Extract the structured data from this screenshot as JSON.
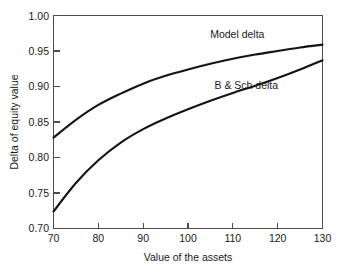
{
  "chart_data": {
    "type": "line",
    "title": "",
    "xlabel": "Value of the assets",
    "ylabel": "Delta of equity value",
    "xlim": [
      70,
      130
    ],
    "ylim": [
      0.7,
      1.0
    ],
    "xticks": [
      "70",
      "80",
      "90",
      "100",
      "110",
      "120",
      "130"
    ],
    "yticks": [
      "0.70",
      "0.75",
      "0.80",
      "0.85",
      "0.90",
      "0.95",
      "1.00"
    ],
    "grid": false,
    "legend_position": "inline-annotations",
    "x": [
      70,
      75,
      80,
      85,
      90,
      95,
      100,
      105,
      110,
      115,
      120,
      125,
      130
    ],
    "series": [
      {
        "name": "Model delta",
        "label": "Model delta",
        "color": "#141414",
        "values": [
          0.828,
          0.853,
          0.874,
          0.89,
          0.904,
          0.915,
          0.924,
          0.932,
          0.939,
          0.945,
          0.95,
          0.955,
          0.959
        ]
      },
      {
        "name": "B & Sch delta",
        "label": "B & Sch delta",
        "color": "#141414",
        "values": [
          0.724,
          0.764,
          0.796,
          0.821,
          0.84,
          0.855,
          0.868,
          0.88,
          0.891,
          0.901,
          0.912,
          0.924,
          0.937
        ]
      }
    ],
    "annotations": [
      {
        "text": "Model delta",
        "x": 111,
        "y": 0.968
      },
      {
        "text": "B & Sch delta",
        "x": 113,
        "y": 0.897
      }
    ]
  },
  "axes": {
    "x_title": "Value of the assets",
    "y_title": "Delta of equity value"
  },
  "labels": {
    "model_delta": "Model delta",
    "bsch_delta": "B & Sch delta"
  },
  "colors": {
    "background": "#ffffff",
    "curve": "#141414",
    "frame": "#4d4d4d",
    "text": "#1a1a1a"
  }
}
